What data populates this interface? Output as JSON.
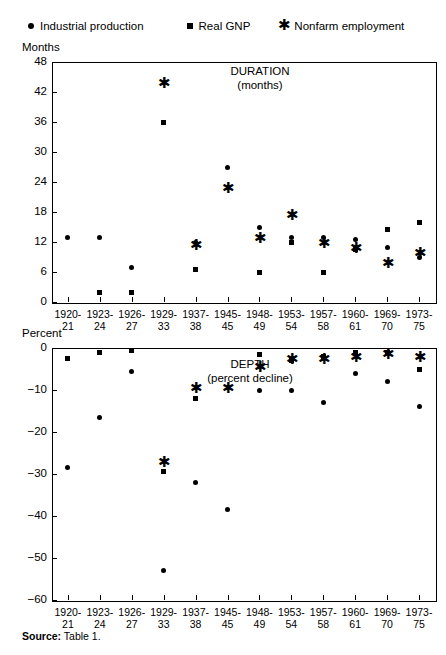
{
  "legend": {
    "items": [
      {
        "icon": "dot-marker-icon",
        "label": "Industrial production",
        "symbol": "●"
      },
      {
        "icon": "square-marker-icon",
        "label": "Real GNP",
        "symbol": "■"
      },
      {
        "icon": "asterisk-marker-icon",
        "label": "Nonfarm employment",
        "symbol": "✱"
      }
    ]
  },
  "source": {
    "prefix": "Source:",
    "text": " Table 1."
  },
  "chart_data": [
    {
      "type": "scatter",
      "title": "DURATION",
      "subtitle": "(months)",
      "axis_label": "Months",
      "xlabel": "",
      "ylabel": "Months",
      "ylim": [
        0,
        48
      ],
      "yticks": [
        0,
        6,
        12,
        18,
        24,
        30,
        36,
        42,
        48
      ],
      "grid": false,
      "legend_position": "top",
      "categories": [
        "1920-\n21",
        "1923-\n24",
        "1926-\n27",
        "1929-\n33",
        "1937-\n38",
        "1945-\n45",
        "1948-\n49",
        "1953-\n54",
        "1957-\n58",
        "1960-\n61",
        "1969-\n70",
        "1973-\n75"
      ],
      "series": [
        {
          "name": "Industrial production",
          "marker": "dot",
          "values": [
            13,
            13,
            7,
            36,
            12,
            27,
            15,
            13,
            13,
            12.5,
            11,
            9
          ]
        },
        {
          "name": "Real GNP",
          "marker": "square",
          "values": [
            null,
            2,
            2,
            36,
            6.5,
            null,
            6,
            12,
            6,
            10.5,
            14.5,
            16
          ]
        },
        {
          "name": "Nonfarm employment",
          "marker": "asterisk",
          "values": [
            null,
            null,
            null,
            43.5,
            11,
            22.5,
            12.5,
            17,
            11.5,
            10.5,
            7.5,
            9.5
          ]
        }
      ]
    },
    {
      "type": "scatter",
      "title": "DEPTH",
      "subtitle": "(percent decline)",
      "axis_label": "Percent",
      "xlabel": "",
      "ylabel": "Percent",
      "ylim": [
        -60,
        0
      ],
      "yticks": [
        0,
        -10,
        -20,
        -30,
        -40,
        -50,
        -60
      ],
      "grid": false,
      "legend_position": "top",
      "categories": [
        "1920-\n21",
        "1923-\n24",
        "1926-\n27",
        "1929-\n33",
        "1937-\n38",
        "1945-\n45",
        "1948-\n49",
        "1953-\n54",
        "1957-\n58",
        "1960-\n61",
        "1969-\n70",
        "1973-\n75"
      ],
      "series": [
        {
          "name": "Industrial production",
          "marker": "dot",
          "values": [
            -28.5,
            -16.5,
            -5.5,
            -53,
            -32,
            -38.5,
            -10,
            -10,
            -13,
            -6,
            -8,
            -14
          ]
        },
        {
          "name": "Real GNP",
          "marker": "square",
          "values": [
            -2.5,
            -1,
            -0.5,
            -29.5,
            -12,
            null,
            -1.5,
            -3,
            -2,
            -1,
            -1,
            -5
          ]
        },
        {
          "name": "Nonfarm employment",
          "marker": "asterisk",
          "values": [
            null,
            null,
            null,
            -27.5,
            -10,
            -10,
            -5,
            -3,
            -3,
            -2.5,
            -2,
            -2.5
          ]
        }
      ]
    }
  ]
}
